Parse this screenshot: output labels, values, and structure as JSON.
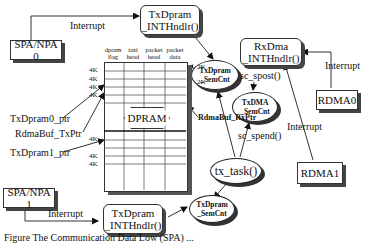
{
  "diagram": {
    "sources": {
      "spa_npa0": "SPA/NPA 0",
      "spa_npa1": "SPA/NPA 1",
      "rdma0": "RDMA0",
      "rdma1": "RDMA1"
    },
    "handlers": {
      "tx_handler_top": "TxDpram _INTHndlr()",
      "tx_handler_bottom": "TxDpram _INTHndlr()",
      "rx_handler": "RxDma _INTHndlr()"
    },
    "semaphores": {
      "txdpram_top": "TxDpram _SemCnt",
      "txdma": "TxDMA _SemCnt",
      "txdpram_bottom": "TxDpram _SemCnt"
    },
    "task": "tx_task()",
    "edge_labels": {
      "interrupt_spa0": "Interrupt",
      "interrupt_spa1": "Interrupt",
      "interrupt_rdma0": "Interrupt",
      "interrupt_rdma1": "Interrupt",
      "sc_spost": "sc_spost()",
      "sc_spend": "sc_spend()"
    },
    "dpram": {
      "title": "DPRAM",
      "columns": [
        "dpram flag",
        "taxi head",
        "packet head",
        "packet data"
      ],
      "size_labels_top": [
        "4K",
        "4K",
        "4K",
        "4K"
      ],
      "size_labels_bottom": [
        "4K",
        "4K",
        "4K"
      ],
      "right_labels": [
        "2K",
        "2K"
      ],
      "pointer_right": "RdmaBuf_RxPtr"
    },
    "pointers": {
      "txdpram0": "TxDpram0_ptr",
      "rdmabuf_tx": "RdmaBuf_TxPtr",
      "txdpram1": "TxDpram1_ptr"
    },
    "caption": "Figure  The Communication Data Low (SPA) ..."
  }
}
